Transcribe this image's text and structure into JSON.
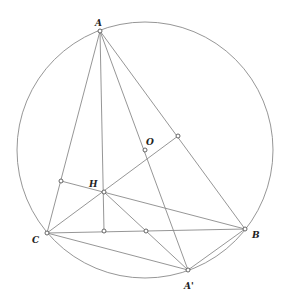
{
  "figure": {
    "type": "geometry-diagram",
    "circle": {
      "center": "O",
      "cx": 145,
      "cy": 150,
      "r": 128
    },
    "points": {
      "A": {
        "label": "A",
        "x": 100,
        "y": 31,
        "lx": 96,
        "ly": 25
      },
      "B": {
        "label": "B",
        "x": 245,
        "y": 229,
        "lx": 252,
        "ly": 238
      },
      "C": {
        "label": "C",
        "x": 47,
        "y": 233,
        "lx": 32,
        "ly": 242
      },
      "O": {
        "label": "O",
        "x": 145,
        "y": 150,
        "lx": 146,
        "ly": 145
      },
      "H": {
        "label": "H",
        "x": 104,
        "y": 192,
        "lx": 89,
        "ly": 187
      },
      "A_prime": {
        "label": "A'",
        "x": 188,
        "y": 270,
        "lx": 185,
        "ly": 289
      },
      "foot_AC": {
        "label": "",
        "x": 61,
        "y": 181
      },
      "foot_BC": {
        "label": "",
        "x": 104,
        "y": 231
      },
      "mid_BC": {
        "label": "",
        "x": 146,
        "y": 231
      },
      "mid_AB": {
        "label": "",
        "x": 178,
        "y": 136
      }
    },
    "labels": {
      "A": "A",
      "B": "B",
      "C": "C",
      "O": "O",
      "H": "H",
      "A_prime": "A'"
    },
    "colors": {
      "line": "#8a8a8a",
      "point_stroke": "#555555",
      "label": "#222222"
    }
  }
}
